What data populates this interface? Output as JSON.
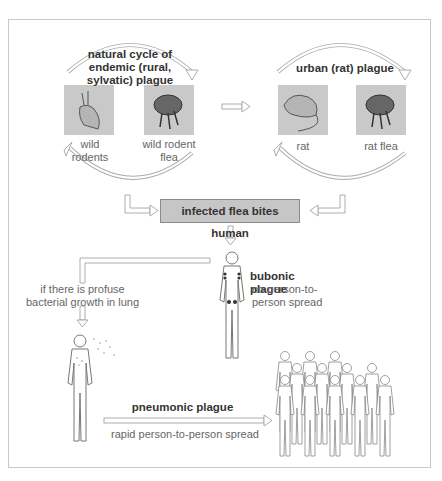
{
  "diagram": {
    "cycles": {
      "endemic": {
        "title": "natural cycle of endemic (rural, sylvatic) plague",
        "title_lines": [
          "natural cycle of",
          "endemic (rural,",
          "sylvatic) plague"
        ],
        "host_label_lines": [
          "wild",
          "rodents"
        ],
        "vector_label_lines": [
          "wild rodent",
          "flea"
        ]
      },
      "urban": {
        "title": "urban (rat) plague",
        "host_label": "rat",
        "vector_label": "rat flea"
      }
    },
    "central_event": "infected flea bites human",
    "branch_condition_lines": [
      "if there is profuse",
      "bacterial growth in lung"
    ],
    "bubonic": {
      "title": "bubonic plague",
      "note_lines": [
        "no person-to-",
        "person spread"
      ]
    },
    "pneumonic": {
      "title": "pneumonic plague",
      "note": "rapid person-to-person spread"
    },
    "colors": {
      "picture_bg": "#c9c9c9",
      "box_bg": "#c6c6c6",
      "frame": "#c8c8c8",
      "text": "#666666",
      "bold_text": "#333333"
    }
  }
}
